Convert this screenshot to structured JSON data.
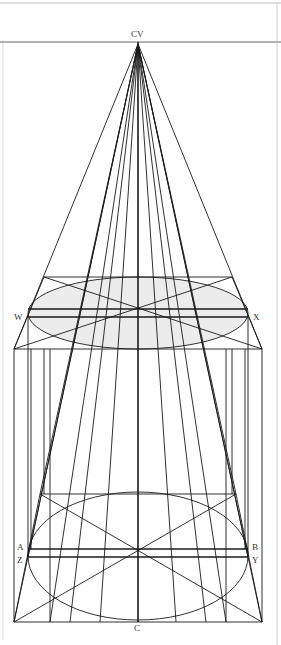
{
  "figure": {
    "kind": "perspective-construction",
    "labels": {
      "cv": "CV",
      "w": "W",
      "x": "X",
      "a": "A",
      "b": "B",
      "z": "Z",
      "y": "Y",
      "c": "C"
    },
    "colors": {
      "line": "#1a1a1a",
      "horizon": "#9a9a9a",
      "ellipse_fill": "#ececec",
      "border": "#bdbdbd"
    }
  }
}
